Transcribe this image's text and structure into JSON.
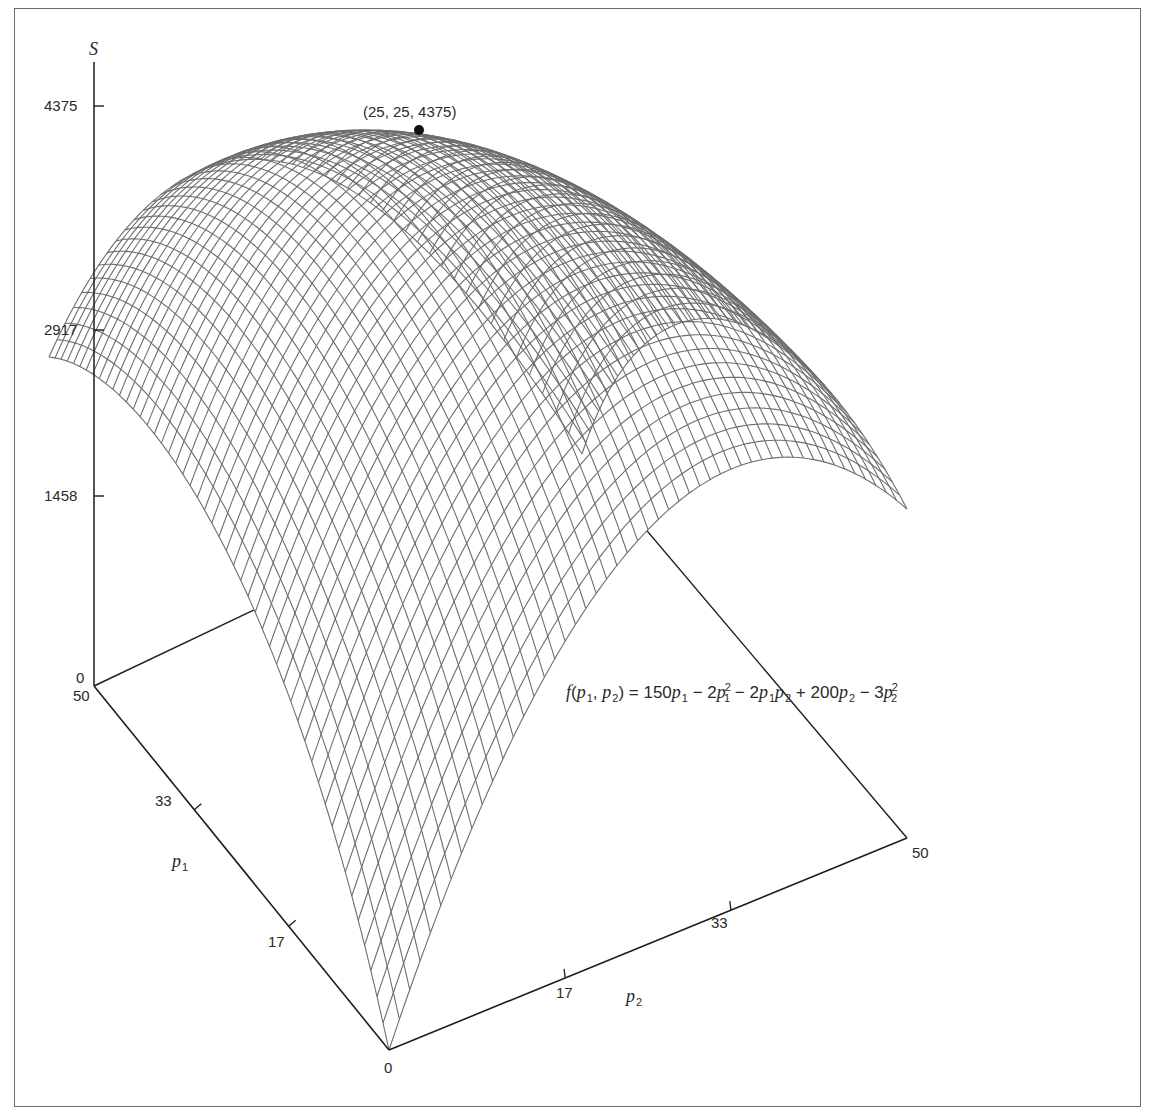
{
  "chart_data": {
    "type": "surface3d",
    "title": "",
    "function_label": "f(p1, p2) = 150p1 − 2p1² − 2p1p2 + 200p2 − 3p2²",
    "function": {
      "c_p1": 150,
      "c_p1sq": -2,
      "c_p1p2": -2,
      "c_p2": 200,
      "c_p2sq": -3
    },
    "axes": {
      "z": {
        "label": "S",
        "ticks": [
          0,
          1458,
          2917,
          4375
        ],
        "range": [
          0,
          4375
        ]
      },
      "p1": {
        "label": "p1",
        "ticks": [
          17,
          33,
          50
        ],
        "range": [
          0,
          50
        ]
      },
      "p2": {
        "label": "p2",
        "ticks": [
          17,
          33,
          50
        ],
        "range": [
          0,
          50
        ]
      },
      "origin_label": "0"
    },
    "mesh": {
      "divisions": 50
    },
    "maximum": {
      "p1": 25,
      "p2": 25,
      "S": 4375,
      "label": "(25, 25, 4375)"
    },
    "surface_corners": [
      {
        "p1": 0,
        "p2": 0,
        "S": 0
      },
      {
        "p1": 50,
        "p2": 0,
        "S": 2500
      },
      {
        "p1": 0,
        "p2": 50,
        "S": 2500
      },
      {
        "p1": 50,
        "p2": 50,
        "S": 0
      }
    ],
    "grid": false,
    "legend": null
  },
  "labels": {
    "z_axis": "S",
    "z_ticks": [
      "4375",
      "2917",
      "1458",
      "0"
    ],
    "p1_ticks": [
      "50",
      "33",
      "17"
    ],
    "p2_ticks": [
      "17",
      "33",
      "50"
    ],
    "origin": "0",
    "p1_name": "p",
    "p1_sub": "1",
    "p2_name": "p",
    "p2_sub": "2",
    "peak": "(25, 25, 4375)"
  },
  "formula": {
    "f": "f",
    "open": "(",
    "p": "p",
    "s1": "1",
    "comma": ", ",
    "s2": "2",
    "close": ")",
    "eq": " = 150",
    "t2": " − 2",
    "sq": "2",
    "t3": " − 2",
    "t4": " + 200",
    "t5": " − 3"
  },
  "colors": {
    "mesh": "#6e6e6e",
    "axis": "#1e1e1e",
    "frame": "#6a6a6a",
    "dot": "#111111"
  }
}
